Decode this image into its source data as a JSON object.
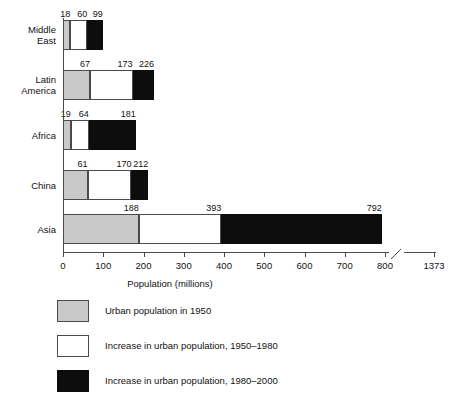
{
  "chart_data": {
    "type": "bar",
    "orientation": "horizontal",
    "stacked": true,
    "title": "",
    "xlabel": "Population (millions)",
    "ylabel": "",
    "xlim": [
      0,
      1373
    ],
    "grid": false,
    "legend_position": "below-left",
    "axis_break": {
      "after": 800,
      "resumes_at": 1373,
      "style": "zigzag"
    },
    "xticks": [
      {
        "value": 0,
        "label": "0"
      },
      {
        "value": 100,
        "label": "100"
      },
      {
        "value": 200,
        "label": "200"
      },
      {
        "value": 300,
        "label": "300"
      },
      {
        "value": 400,
        "label": "400"
      },
      {
        "value": 500,
        "label": "500"
      },
      {
        "value": 600,
        "label": "600"
      },
      {
        "value": 700,
        "label": "700"
      },
      {
        "value": 800,
        "label": "800"
      },
      {
        "value": 1373,
        "label": "1373"
      }
    ],
    "categories": [
      "Middle\nEast",
      "Latin\nAmerica",
      "Africa",
      "China",
      "Asia"
    ],
    "series": [
      {
        "name": "Urban population in 1950",
        "key": "urban1950",
        "color": "#c9c9c9",
        "values": [
          18,
          67,
          19,
          61,
          188
        ]
      },
      {
        "name": "Increase in urban population, 1950–1980",
        "key": "inc5080",
        "color": "#ffffff",
        "values": [
          42,
          106,
          45,
          109,
          205
        ]
      },
      {
        "name": "Increase in urban population, 1980–2000",
        "key": "inc8000",
        "color": "#0d0d0d",
        "values": [
          39,
          53,
          117,
          42,
          399
        ]
      }
    ],
    "cumulative_labels": [
      [
        "18",
        "60",
        "99"
      ],
      [
        "67",
        "173",
        "226"
      ],
      [
        "19",
        "64",
        "181"
      ],
      [
        "61",
        "170",
        "212"
      ],
      [
        "188",
        "393",
        "792"
      ]
    ],
    "cumulative_values": [
      [
        18,
        60,
        99
      ],
      [
        67,
        173,
        226
      ],
      [
        19,
        64,
        181
      ],
      [
        61,
        170,
        212
      ],
      [
        188,
        393,
        792
      ]
    ]
  },
  "legend": {
    "items": [
      {
        "label": "Urban population in 1950",
        "key": "urban1950"
      },
      {
        "label": "Increase in urban population, 1950–1980",
        "key": "inc5080"
      },
      {
        "label": "Increase in urban population, 1980–2000",
        "key": "inc8000"
      }
    ]
  },
  "axis": {
    "x_title": "Population (millions)"
  }
}
